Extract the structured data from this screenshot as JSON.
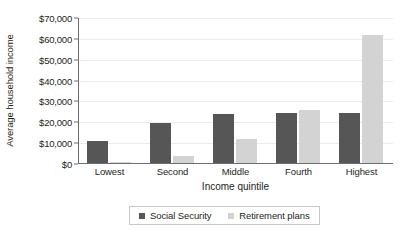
{
  "chart_data": {
    "type": "bar",
    "title": "",
    "xlabel": "Income quintile",
    "ylabel": "Average household income",
    "categories": [
      "Lowest",
      "Second",
      "Middle",
      "Fourth",
      "Highest"
    ],
    "series": [
      {
        "name": "Social Security",
        "color": "#565656",
        "values": [
          10500,
          19000,
          23500,
          24000,
          23800
        ]
      },
      {
        "name": "Retirement plans",
        "color": "#d3d3d3",
        "values": [
          300,
          3500,
          11500,
          25500,
          61500
        ]
      }
    ],
    "ylim": [
      0,
      70000
    ],
    "ytick_values": [
      0,
      10000,
      20000,
      30000,
      40000,
      50000,
      60000,
      70000
    ],
    "ytick_labels": [
      "$0",
      "$10,000",
      "$20,000",
      "$30,000",
      "$40,000",
      "$50,000",
      "$60,000",
      "$70,000"
    ],
    "grid": true,
    "legend_position": "bottom"
  },
  "legend": {
    "items": [
      {
        "label": "Social Security",
        "swatch_name": "legend-swatch-social-security"
      },
      {
        "label": "Retirement plans",
        "swatch_name": "legend-swatch-retirement-plans"
      }
    ]
  }
}
